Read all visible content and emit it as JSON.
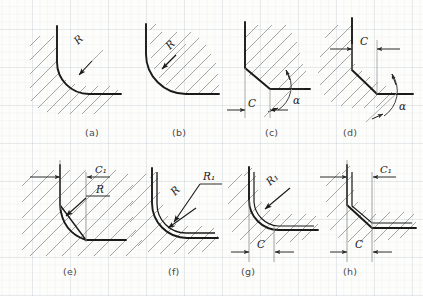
{
  "figure": {
    "kind": "engineering-drawing",
    "medium": "scanned graph paper",
    "panel_count": 8,
    "colors": {
      "paper": "#fdfdfb",
      "contour": "#1a1a1a",
      "hatch": "#8a8a8a",
      "dimension": "#3c3c3c",
      "grid": "#8fa3b4",
      "caption": "#4a4a4a"
    }
  },
  "panels": [
    {
      "id": "a",
      "caption": "(a)",
      "type": "fillet",
      "description": "internal rounded corner, material hatched outside the arc",
      "labels": [
        {
          "text": "R",
          "role": "radius"
        }
      ]
    },
    {
      "id": "b",
      "caption": "(b)",
      "type": "fillet",
      "description": "external rounded corner, material hatched inside the arc",
      "labels": [
        {
          "text": "R",
          "role": "radius"
        }
      ]
    },
    {
      "id": "c",
      "caption": "(c)",
      "type": "chamfer",
      "description": "internal chamfer dimensioned by width and angle",
      "labels": [
        {
          "text": "C",
          "role": "chamfer-width"
        },
        {
          "text": "α",
          "role": "chamfer-angle"
        }
      ]
    },
    {
      "id": "d",
      "caption": "(d)",
      "type": "chamfer",
      "description": "external chamfer dimensioned by width and angle",
      "labels": [
        {
          "text": "C",
          "role": "chamfer-width"
        },
        {
          "text": "α",
          "role": "chamfer-angle"
        }
      ]
    },
    {
      "id": "e",
      "caption": "(e)",
      "type": "chamfer-and-fillet",
      "description": "chamfer width with fillet radius on the same corner",
      "labels": [
        {
          "text": "C₁",
          "role": "chamfer-width"
        },
        {
          "text": "R",
          "role": "radius"
        }
      ]
    },
    {
      "id": "f",
      "caption": "(f)",
      "type": "double-fillet",
      "description": "two concentric corner radii",
      "labels": [
        {
          "text": "R",
          "role": "radius-inner"
        },
        {
          "text": "R₁",
          "role": "radius-outer"
        }
      ]
    },
    {
      "id": "g",
      "caption": "(g)",
      "type": "fillet-and-chamfer",
      "description": "corner radius with chamfer width dimension",
      "labels": [
        {
          "text": "R₁",
          "role": "radius"
        },
        {
          "text": "C",
          "role": "chamfer-width"
        }
      ]
    },
    {
      "id": "h",
      "caption": "(h)",
      "type": "double-chamfer",
      "description": "corner with two chamfer width dimensions",
      "labels": [
        {
          "text": "C₁",
          "role": "chamfer-width-upper"
        },
        {
          "text": "C",
          "role": "chamfer-width-lower"
        }
      ]
    }
  ],
  "captions": {
    "a": "(a)",
    "b": "(b)",
    "c": "(c)",
    "d": "(d)",
    "e": "(e)",
    "f": "(f)",
    "g": "(g)",
    "h": "(h)"
  },
  "symbols": {
    "R": "R",
    "R1": "R₁",
    "C": "C",
    "C1": "C₁",
    "alpha": "α"
  }
}
